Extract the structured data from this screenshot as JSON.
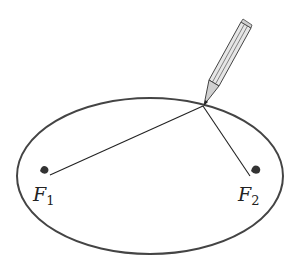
{
  "diagram": {
    "type": "ellipse-construction",
    "foci": [
      {
        "name": "F",
        "subscript": "1",
        "x": 46,
        "y": 172
      },
      {
        "name": "F",
        "subscript": "2",
        "x": 255,
        "y": 172
      }
    ],
    "ellipse": {
      "cx": 150,
      "cy": 176,
      "rx": 133,
      "ry": 78
    },
    "pencil_tip": {
      "x": 203,
      "y": 106
    },
    "colors": {
      "stroke": "#333333",
      "pencil_fill": "#d9d9d9"
    }
  }
}
